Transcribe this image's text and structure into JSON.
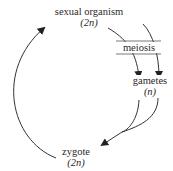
{
  "diagram": {
    "type": "life-cycle",
    "nodes": {
      "organism": {
        "label": "sexual organism",
        "ploidy": "(2n)"
      },
      "meiosis": {
        "label": "meiosis"
      },
      "gametes": {
        "label": "gametes",
        "ploidy": "(n)"
      },
      "zygote": {
        "label": "zygote",
        "ploidy": "(2n)"
      }
    },
    "edges": [
      {
        "from": "sexual organism",
        "to": "gametes",
        "via": "meiosis",
        "count": 2
      },
      {
        "from": "gametes",
        "to": "zygote",
        "count": 2,
        "note": "two gametes merge"
      },
      {
        "from": "zygote",
        "to": "sexual organism",
        "count": 1
      }
    ],
    "colors": {
      "line": "#333333",
      "text": "#2a2a2a",
      "background": "#ffffff"
    }
  }
}
